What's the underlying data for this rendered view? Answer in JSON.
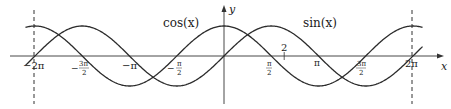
{
  "chart_data": {
    "type": "line",
    "title": "",
    "xlabel": "x",
    "ylabel": "y",
    "xlim": [
      -6.8,
      6.8
    ],
    "ylim": [
      -1.6,
      1.7
    ],
    "grid": false,
    "series": [
      {
        "name": "cos(x)",
        "function": "cos(x)",
        "label_position": "upper-left of y-axis"
      },
      {
        "name": "sin(x)",
        "function": "sin(x)",
        "label_position": "upper-right of y-axis"
      }
    ],
    "x_ticks": [
      "-2π",
      "-3π/2",
      "-π",
      "-π/2",
      "π/2",
      "π",
      "3π/2",
      "2π"
    ],
    "x_tick_values": [
      -6.2832,
      -4.7124,
      -3.1416,
      -1.5708,
      1.5708,
      3.1416,
      4.7124,
      6.2832
    ],
    "annotations": [
      {
        "text": "2",
        "x": 2,
        "note": "tick mark above x-axis at x=2"
      },
      {
        "type": "vertical-dashed-line",
        "x": -6.2832
      },
      {
        "type": "vertical-dashed-line",
        "x": 6.2832
      }
    ]
  },
  "labels": {
    "cos": "cos(x)",
    "sin": "sin(x)",
    "x_axis": "x",
    "y_axis": "y",
    "two": "2",
    "ticks": {
      "m2pi": "−2π",
      "m3pi2_num": "3π",
      "m3pi2_den": "2",
      "mpi": "−π",
      "mpi2_num": "π",
      "mpi2_den": "2",
      "pi2_num": "π",
      "pi2_den": "2",
      "pi": "π",
      "p3pi2_num": "3π",
      "p3pi2_den": "2",
      "p2pi": "2π"
    }
  }
}
